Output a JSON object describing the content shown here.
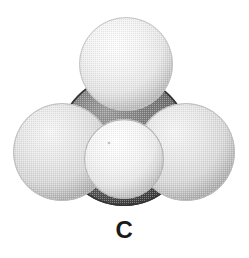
{
  "figure": {
    "kind": "space-filling-molecular-model",
    "molecule": "methane",
    "background_color": "#ffffff",
    "atoms": [
      {
        "id": "carbon-center",
        "element": "C",
        "role": "central-atom",
        "cx": 124,
        "cy": 141,
        "r": 65,
        "base_color": "#6e6e6e",
        "highlight_color": "#9a9a9a",
        "shadow_color": "#4a4a4a",
        "outline_color": "#2e2e2e",
        "z": 1
      },
      {
        "id": "hydrogen-top",
        "element": "H",
        "role": "top-atom",
        "cx": 126,
        "cy": 64,
        "r": 47,
        "base_color": "#e8e8e8",
        "highlight_color": "#fbfbfb",
        "shadow_color": "#bdbdbd",
        "outline_color": "#c9c9c9",
        "z": 2
      },
      {
        "id": "hydrogen-left",
        "element": "H",
        "role": "left-atom",
        "cx": 62,
        "cy": 152,
        "r": 49,
        "base_color": "#dcdcdc",
        "highlight_color": "#f4f4f4",
        "shadow_color": "#b0b0b0",
        "outline_color": "#bcbcbc",
        "z": 3
      },
      {
        "id": "hydrogen-right",
        "element": "H",
        "role": "right-atom",
        "cx": 186,
        "cy": 152,
        "r": 49,
        "base_color": "#dcdcdc",
        "highlight_color": "#f4f4f4",
        "shadow_color": "#b0b0b0",
        "outline_color": "#bcbcbc",
        "z": 4
      },
      {
        "id": "hydrogen-front",
        "element": "H",
        "role": "front-atom",
        "cx": 124,
        "cy": 159,
        "r": 40,
        "base_color": "#ececec",
        "highlight_color": "#fdfdfd",
        "shadow_color": "#c2c2c2",
        "outline_color": "#b8b8b8",
        "z": 5
      }
    ]
  },
  "caption": {
    "label": "C"
  }
}
